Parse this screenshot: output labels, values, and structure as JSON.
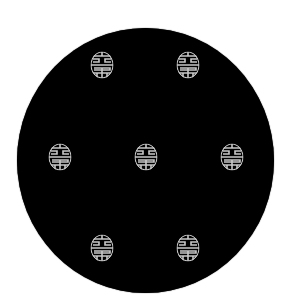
{
  "image": {
    "subject": "black round plate with shou longevity medallions",
    "background_color": "#ffffff",
    "plate_color": "#000000",
    "motif_color": "#c8c8c8",
    "motif": "shou-character medallion",
    "motif_count": 7,
    "motifs": [
      {
        "cx": 102,
        "cy": 65
      },
      {
        "cx": 188,
        "cy": 65
      },
      {
        "cx": 60,
        "cy": 157
      },
      {
        "cx": 146,
        "cy": 157
      },
      {
        "cx": 232,
        "cy": 157
      },
      {
        "cx": 102,
        "cy": 248
      },
      {
        "cx": 188,
        "cy": 248
      }
    ]
  }
}
